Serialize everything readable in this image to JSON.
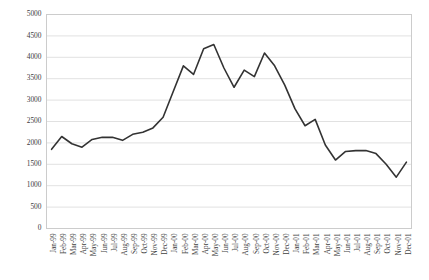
{
  "chart_data": {
    "type": "line",
    "title": "",
    "subtitle": "",
    "xlabel": "",
    "ylabel": "",
    "ylim": [
      0,
      5000
    ],
    "ytick_step": 500,
    "grid": true,
    "grid_axis": "y",
    "legend": false,
    "legend_position": "none",
    "line_color": "#333333",
    "grid_color": "#d9d9d9",
    "border_color": "#cccccc",
    "text_color": "#404040",
    "yticks": [
      0,
      500,
      1000,
      1500,
      2000,
      2500,
      3000,
      3500,
      4000,
      4500,
      5000
    ],
    "ytick_labels": [
      "0",
      "500",
      "1000",
      "1500",
      "2000",
      "2500",
      "3000",
      "3500",
      "4000",
      "4500",
      "5000"
    ],
    "categories": [
      "Jan-99",
      "Feb-99",
      "Mar-99",
      "Apr-99",
      "May-99",
      "Jun-99",
      "Jul-99",
      "Aug-99",
      "Sep-99",
      "Oct-99",
      "Nov-99",
      "Dec-99",
      "Jan-00",
      "Feb-00",
      "Mar-00",
      "Apr-00",
      "May-00",
      "Jun-00",
      "Jul-00",
      "Aug-00",
      "Sep-00",
      "Oct-00",
      "Nov-00",
      "Dec-00",
      "Jan-01",
      "Feb-01",
      "Mar-01",
      "Apr-01",
      "May-01",
      "Jun-01",
      "Jul-01",
      "Aug-01",
      "Sep-01",
      "Oct-01",
      "Nov-01",
      "Dec-01"
    ],
    "values": [
      1850,
      2150,
      1980,
      1900,
      2080,
      2130,
      2130,
      2060,
      2200,
      2250,
      2350,
      2600,
      3200,
      3800,
      3600,
      4200,
      4300,
      3750,
      3300,
      3700,
      3550,
      4100,
      3800,
      3350,
      2800,
      2400,
      2550,
      1950,
      1600,
      1800,
      1820,
      1820,
      1750,
      1500,
      1200,
      1550
    ]
  }
}
